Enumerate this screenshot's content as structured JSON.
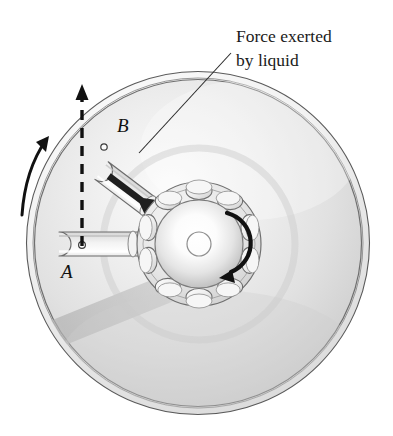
{
  "figure": {
    "type": "technical-illustration",
    "background_color": "#ffffff",
    "canvas": {
      "width": 393,
      "height": 436
    }
  },
  "annotations": {
    "force_label": {
      "line1": "Force exerted",
      "line2": "by liquid",
      "color": "#1a1a1a",
      "points_to": "arm-b-force-arrow"
    },
    "arm_a_label": {
      "text": "A",
      "style": "italic-serif",
      "color": "#111111"
    },
    "arm_b_label": {
      "text": "B",
      "style": "italic-serif",
      "color": "#111111"
    }
  },
  "disc": {
    "center_x": 198,
    "center_y": 243,
    "outer_radius": 172,
    "rim_inner_radius": 163,
    "face_color": "#e9e9e9",
    "rim_color": "#f6f6f6",
    "outline_color": "#4a4a4a"
  },
  "hub": {
    "center_x": 199,
    "center_y": 244,
    "flange_radius": 62,
    "ball_radius": 44,
    "bore_radius": 12,
    "port_count": 10,
    "port_ring_radius": 53,
    "color": "#e2e2e2"
  },
  "arms": [
    {
      "id": "A",
      "label": "A",
      "angle_deg": 180,
      "tip_x": 48,
      "tip_y": 245,
      "pivot_hole_x": 82,
      "pivot_hole_y": 245,
      "description": "horizontal arm pointing left, nozzle hole near tip"
    },
    {
      "id": "B",
      "label": "B",
      "angle_deg": 217,
      "tip_x": 101,
      "tip_y": 142,
      "pivot_hole_x": 104,
      "pivot_hole_y": 147,
      "description": "upper-left arm with bold force arrow drawn along it"
    }
  ],
  "vectors": {
    "velocity_dashed": {
      "name": "dashed-velocity-line",
      "from_x": 82,
      "from_y": 248,
      "to_x": 82,
      "to_y": 86,
      "style": "dashed-with-arrowhead",
      "color": "#111111"
    },
    "rotation_outer": {
      "name": "disc-rotation-arrow",
      "direction": "counterclockwise-at-left-edge",
      "color": "#111111"
    },
    "rotation_hub": {
      "name": "hub-rotation-arrow",
      "direction": "clockwise",
      "color": "#111111"
    },
    "force_arrow": {
      "name": "force-arrow-along-arm-b",
      "direction": "inward along arm B toward hub",
      "color": "#1f1f1f"
    }
  },
  "colors": {
    "ink": "#1a1a1a",
    "disc_light": "#f4f4f4",
    "disc_mid": "#dcdcdc",
    "disc_shadow": "#c4c4c4",
    "tube_fill": "#f2f2f2"
  }
}
